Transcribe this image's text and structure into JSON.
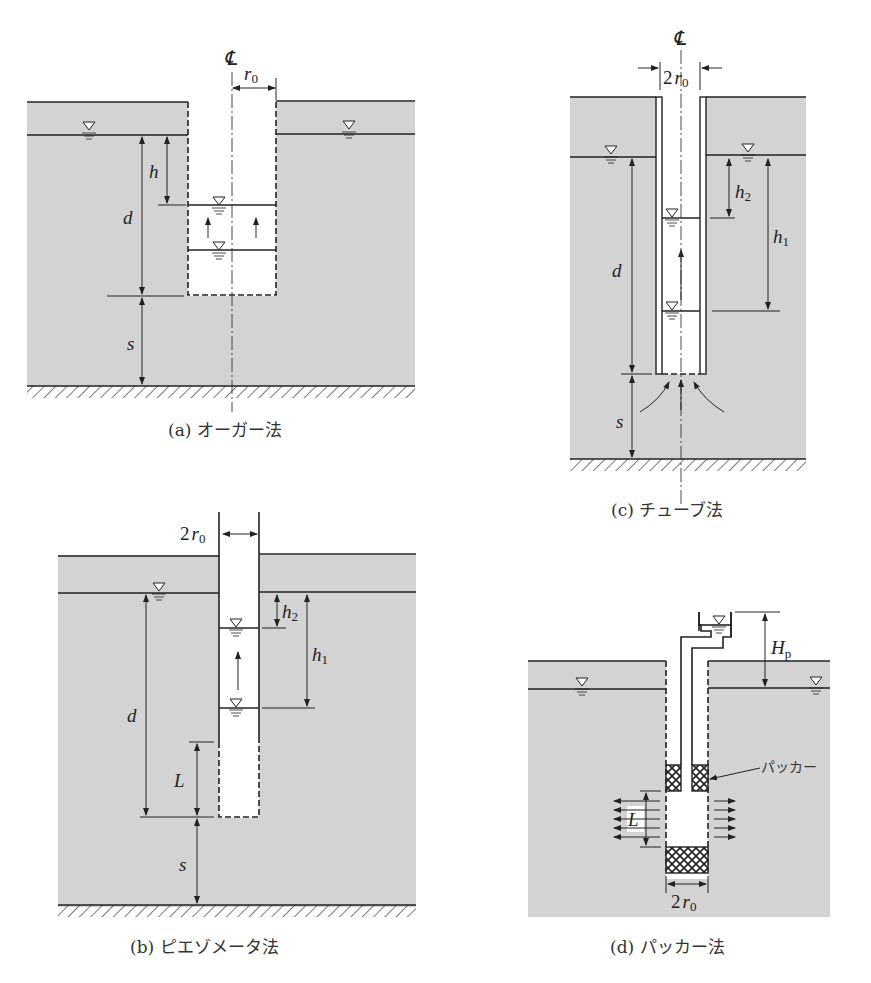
{
  "figure": {
    "panels": [
      {
        "id": "a",
        "caption": "(a) オーガー法",
        "centerline_symbol": "℄",
        "labels": {
          "radius": "r",
          "radius_sub": "0",
          "h": "h",
          "d": "d",
          "s": "s"
        }
      },
      {
        "id": "b",
        "caption": "(b) ピエゾメータ法",
        "labels": {
          "diameter_coef": "2",
          "radius": "r",
          "radius_sub": "0",
          "h2": "h",
          "h2_sub": "2",
          "h1": "h",
          "h1_sub": "1",
          "d": "d",
          "L": "L",
          "s": "s"
        }
      },
      {
        "id": "c",
        "caption": "(c) チューブ法",
        "centerline_symbol": "℄",
        "labels": {
          "diameter_coef": "2",
          "radius": "r",
          "radius_sub": "0",
          "h2": "h",
          "h2_sub": "2",
          "h1": "h",
          "h1_sub": "1",
          "d": "d",
          "s": "s"
        }
      },
      {
        "id": "d",
        "caption": "(d) パッカー法",
        "labels": {
          "Hp": "H",
          "Hp_sub": "p",
          "packer": "パッカー",
          "L": "L",
          "diameter_coef": "2",
          "radius": "r",
          "radius_sub": "0"
        }
      }
    ],
    "symbols": {
      "water_table": "water-level-triangle"
    },
    "colors": {
      "soil": "#d3d3d3",
      "line": "#222222",
      "background": "#ffffff"
    }
  }
}
